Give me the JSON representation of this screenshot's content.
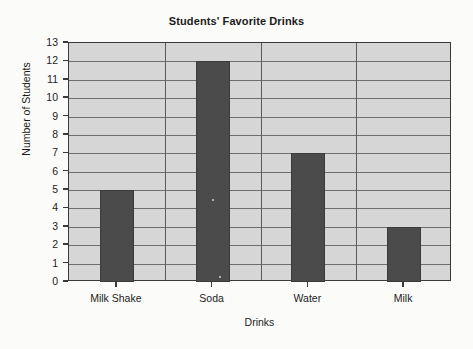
{
  "chart_data": {
    "type": "bar",
    "title": "Students' Favorite Drinks",
    "xlabel": "Drinks",
    "ylabel": "Number of Students",
    "categories": [
      "Milk Shake",
      "Soda",
      "Water",
      "Milk"
    ],
    "values": [
      5,
      12,
      7,
      3
    ],
    "ylim": [
      0,
      13
    ],
    "ytick_step": 1,
    "yticks": [
      13,
      12,
      11,
      10,
      9,
      8,
      7,
      6,
      5,
      4,
      3,
      2,
      1,
      0
    ],
    "grid": "horizontal-and-vertical",
    "legend": "none",
    "series": [
      {
        "name": "Number of Students",
        "values": [
          5,
          12,
          7,
          3
        ]
      }
    ],
    "colors": {
      "bar_fill": "#4b4b4b",
      "plot_background": "#d6d6d6",
      "gridline": "#6e6e6e",
      "axis": "#3a3a3a",
      "text": "#1b1b1b",
      "page_background": "#fbfbfa"
    }
  }
}
